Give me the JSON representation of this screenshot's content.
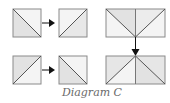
{
  "caption": "Diagram C",
  "colors": {
    "stroke": "#7a7a7a",
    "dark_fill": "#e2e2e2",
    "light_fill": "#f4f4f4",
    "arrow": "#111111"
  },
  "shapes": [
    {
      "id": "square-1",
      "type": "square",
      "diagonal": "top-left to bottom-right"
    },
    {
      "id": "square-2",
      "type": "square",
      "diagonal": "bottom-left to top-right"
    },
    {
      "id": "rect-1",
      "type": "rectangle",
      "lines": "top corners to bottom center, vertical center"
    },
    {
      "id": "square-3",
      "type": "square",
      "diagonal": "bottom-left to top-right"
    },
    {
      "id": "square-4",
      "type": "square",
      "diagonal": "top-left to bottom-right"
    },
    {
      "id": "rect-2",
      "type": "rectangle",
      "lines": "top center to bottom corners, vertical center"
    }
  ],
  "arrows": [
    {
      "from": "square-1",
      "to": "square-2",
      "direction": "right"
    },
    {
      "from": "square-3",
      "to": "square-4",
      "direction": "right"
    },
    {
      "from": "rect-1",
      "to": "rect-2",
      "direction": "down"
    }
  ]
}
